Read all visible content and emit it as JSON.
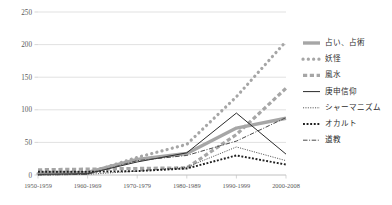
{
  "chart_data": {
    "type": "line",
    "title": "",
    "subtitle": "",
    "xlabel": "",
    "ylabel": "",
    "grid": true,
    "legend_position": "right",
    "ylim": [
      0,
      250
    ],
    "yticks": [
      0,
      50,
      100,
      150,
      200,
      250
    ],
    "ytick_labels": [
      "0",
      "50",
      "100",
      "150",
      "200",
      "250"
    ],
    "categories": [
      "1950-1959",
      "1960-1969",
      "1970-1979",
      "1980-1989",
      "1990-1999",
      "2000-2008"
    ],
    "series": [
      {
        "name": "占い、占術",
        "style": "thick-solid",
        "color": "#a6a6a6",
        "values": [
          3,
          4,
          24,
          33,
          72,
          87
        ]
      },
      {
        "name": "妖怪",
        "style": "dotted-round",
        "color": "#a6a6a6",
        "values": [
          2,
          3,
          27,
          47,
          120,
          205
        ]
      },
      {
        "name": "風水",
        "style": "dashed-square",
        "color": "#a6a6a6",
        "values": [
          8,
          9,
          10,
          11,
          62,
          133
        ]
      },
      {
        "name": "庚申信仰",
        "style": "thin-solid",
        "color": "#2b2b2b",
        "values": [
          1,
          2,
          20,
          34,
          95,
          32
        ]
      },
      {
        "name": "シャーマニズム",
        "style": "fine-dotted",
        "color": "#2b2b2b",
        "values": [
          0,
          1,
          6,
          12,
          43,
          22
        ]
      },
      {
        "name": "オカルト",
        "style": "coarse-dotted",
        "color": "#1f1f1f",
        "values": [
          5,
          5,
          6,
          10,
          30,
          16
        ]
      },
      {
        "name": "道教",
        "style": "dash-dot",
        "color": "#4a4a4a",
        "values": [
          0,
          1,
          22,
          30,
          52,
          88
        ]
      }
    ]
  }
}
